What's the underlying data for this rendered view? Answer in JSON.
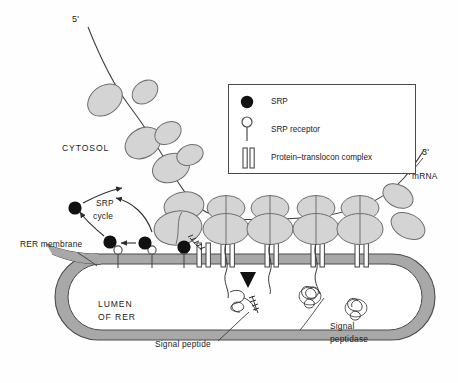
{
  "figure": {
    "background": "#ffffff"
  },
  "colors": {
    "membrane_fill": "#a8a8a8",
    "membrane_stroke": "#4a4a4a",
    "ribosome_fill": "#d4d4d4",
    "ribosome_stroke": "#6e6e6e",
    "srp_fill": "#111111",
    "line": "#3a3a3a",
    "text": "#1a1a1a",
    "lumen_fill": "#ffffff",
    "legend_border": "#4a4a4a"
  },
  "labels": {
    "five_prime": "5'",
    "three_prime": "3'",
    "mrna": "mRNA",
    "cytosol": "CYTOSOL",
    "srp_cycle_line1": "SRP",
    "srp_cycle_line2": "cycle",
    "rer_membrane": "RER membrane",
    "lumen_line1": "LUMEN",
    "lumen_line2": "OF RER",
    "signal_peptide": "Signal peptide",
    "signal_peptidase_line1": "Signal",
    "signal_peptidase_line2": "peptidase"
  },
  "legend": {
    "items": [
      {
        "icon": "srp-dot-icon",
        "label": "SRP"
      },
      {
        "icon": "srp-receptor-icon",
        "label": "SRP receptor"
      },
      {
        "icon": "translocon-icon",
        "label": "Protein–translocon complex"
      }
    ]
  },
  "diagram_elements": {
    "free_ribosome_subunits": 6,
    "membrane_bound_ribosomes": 4,
    "srp_particles": 4,
    "srp_receptors": 3,
    "translocons": 5,
    "folded_proteins_in_lumen": 2,
    "signal_peptidase_markers": 1
  }
}
